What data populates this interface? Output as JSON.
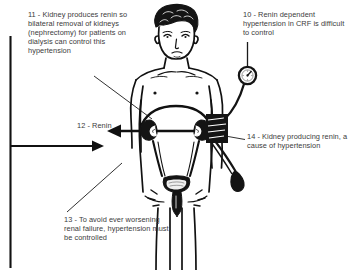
{
  "diagram": {
    "text_color": "#3b3b3b",
    "ink_color": "#111111",
    "background": "#ffffff"
  },
  "annotations": [
    {
      "id": "11",
      "number": "11",
      "text": "11 - Kidney produces renin so bilateral removal of kidneys (nephrectomy) for patients on dialysis can control this hypertension",
      "leader": "diagonal-down-right-to-kidney"
    },
    {
      "id": "10",
      "number": "10",
      "text": "10 - Renin dependent hypertension in CRF is difficult to control",
      "leader": "vertical-down-to-pressure-gauge"
    },
    {
      "id": "12",
      "number": "12",
      "text": "12 - Renin",
      "leader": "horizontal-arrow-pointing-left"
    },
    {
      "id": "14",
      "number": "14",
      "text": "14 - Kidney producing renin, a cause of hypertension",
      "leader": "diagonal-left-to-right-kidney"
    },
    {
      "id": "13",
      "number": "13",
      "text": "13 - To avoid ever worsening renal failure, hypertension must be controlled",
      "leader": "diagonal-up-right-to-bladder"
    }
  ],
  "figure": {
    "anatomy": [
      "head-with-curly-hair",
      "neck",
      "shoulders",
      "chest-with-nipples",
      "abdomen",
      "left-kidney",
      "right-kidney",
      "renal-arteries",
      "ureters",
      "bladder",
      "urethra",
      "legs"
    ]
  },
  "devices": {
    "blood_pressure_cuff": "sphygmomanometer cuff on upper arm",
    "pressure_gauge": "round manometer dial",
    "tubing": "rubber tube from cuff to gauge",
    "bulb": "inflation bulb"
  },
  "frame": {
    "left_rule": "vertical line along left margin",
    "flow_arrow": "horizontal arrow pointing right into the diagram"
  }
}
